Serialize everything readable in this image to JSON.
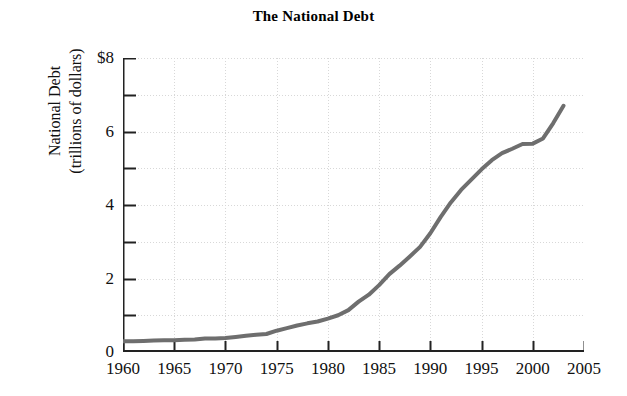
{
  "chart_data": {
    "type": "line",
    "title": "The National Debt",
    "xlabel": "",
    "ylabel": "National Debt\n(trillions of dollars)",
    "ylabel_line1": "National Debt",
    "ylabel_line2": "(trillions of dollars)",
    "xlim": [
      1960,
      2005
    ],
    "ylim": [
      0,
      8
    ],
    "grid": true,
    "legend": "none",
    "y_tick_labels": [
      "0",
      "2",
      "4",
      "6",
      "$8"
    ],
    "y_tick_values": [
      0,
      2,
      4,
      6,
      8
    ],
    "y_minor_tick_values": [
      1,
      3,
      5,
      7
    ],
    "x_tick_labels": [
      "1960",
      "1965",
      "1970",
      "1975",
      "1980",
      "1985",
      "1990",
      "1995",
      "2000",
      "2005"
    ],
    "x_tick_values": [
      1960,
      1965,
      1970,
      1975,
      1980,
      1985,
      1990,
      1995,
      2000,
      2005
    ],
    "series": [
      {
        "name": "National Debt",
        "color": "#6e6e6e",
        "x": [
          1960,
          1961,
          1962,
          1963,
          1964,
          1965,
          1966,
          1967,
          1968,
          1969,
          1970,
          1971,
          1972,
          1973,
          1974,
          1975,
          1976,
          1977,
          1978,
          1979,
          1980,
          1981,
          1982,
          1983,
          1984,
          1985,
          1986,
          1987,
          1988,
          1989,
          1990,
          1991,
          1992,
          1993,
          1994,
          1995,
          1996,
          1997,
          1998,
          1999,
          2000,
          2001,
          2002,
          2003
        ],
        "values": [
          0.29,
          0.29,
          0.3,
          0.31,
          0.32,
          0.32,
          0.33,
          0.34,
          0.37,
          0.37,
          0.38,
          0.41,
          0.44,
          0.47,
          0.49,
          0.58,
          0.65,
          0.72,
          0.78,
          0.83,
          0.91,
          1.0,
          1.14,
          1.37,
          1.56,
          1.82,
          2.12,
          2.35,
          2.6,
          2.86,
          3.23,
          3.67,
          4.07,
          4.41,
          4.69,
          4.97,
          5.22,
          5.41,
          5.53,
          5.66,
          5.67,
          5.81,
          6.23,
          6.7
        ]
      }
    ]
  }
}
